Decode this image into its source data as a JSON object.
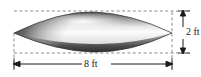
{
  "figure": {
    "shape_name": "spindle-solid",
    "background_color": "#ffffff"
  },
  "dimensions": {
    "width": {
      "label": "8 ft",
      "value": 8,
      "unit": "ft",
      "orientation": "horizontal"
    },
    "height": {
      "label": "2 ft",
      "value": 2,
      "unit": "ft",
      "orientation": "vertical"
    }
  },
  "guides": {
    "top_dashed_line": "dashed",
    "bottom_dashed_line": "dashed",
    "left_dashed_line": "dashed",
    "right_dashed_line": "dashed"
  },
  "colors": {
    "outline": "#2b2b2b",
    "dimension_line": "#1a1a1a",
    "guide_line": "#6e6e6e",
    "shade_dark": "#3c3c3c",
    "shade_mid": "#9a9a9a",
    "shade_light": "#f2f2f2",
    "shade_bottom": "#555555"
  }
}
